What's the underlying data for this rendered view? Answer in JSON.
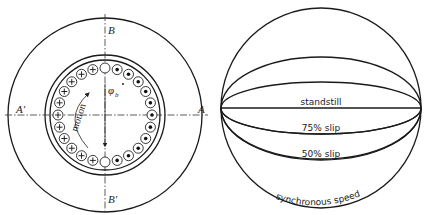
{
  "left_diagram": {
    "labels": {
      "a": "A",
      "a_prime": "A′",
      "b": "B",
      "b_prime": "B′",
      "flux": "φ",
      "flux_sub": "b",
      "motion": "motion"
    },
    "conductors": {
      "count": 24,
      "left_side_symbol": "⊕ (current into page)",
      "right_side_symbol": "⊙ (current out of page)",
      "top_bottom_symbol": "empty"
    }
  },
  "right_diagram": {
    "curves": [
      {
        "label": "standstill"
      },
      {
        "label": "75% slip"
      },
      {
        "label": "50% slip"
      },
      {
        "label": "synchronous speed"
      }
    ]
  },
  "colors": {
    "stroke": "#1a1a1a",
    "background": "#ffffff"
  }
}
